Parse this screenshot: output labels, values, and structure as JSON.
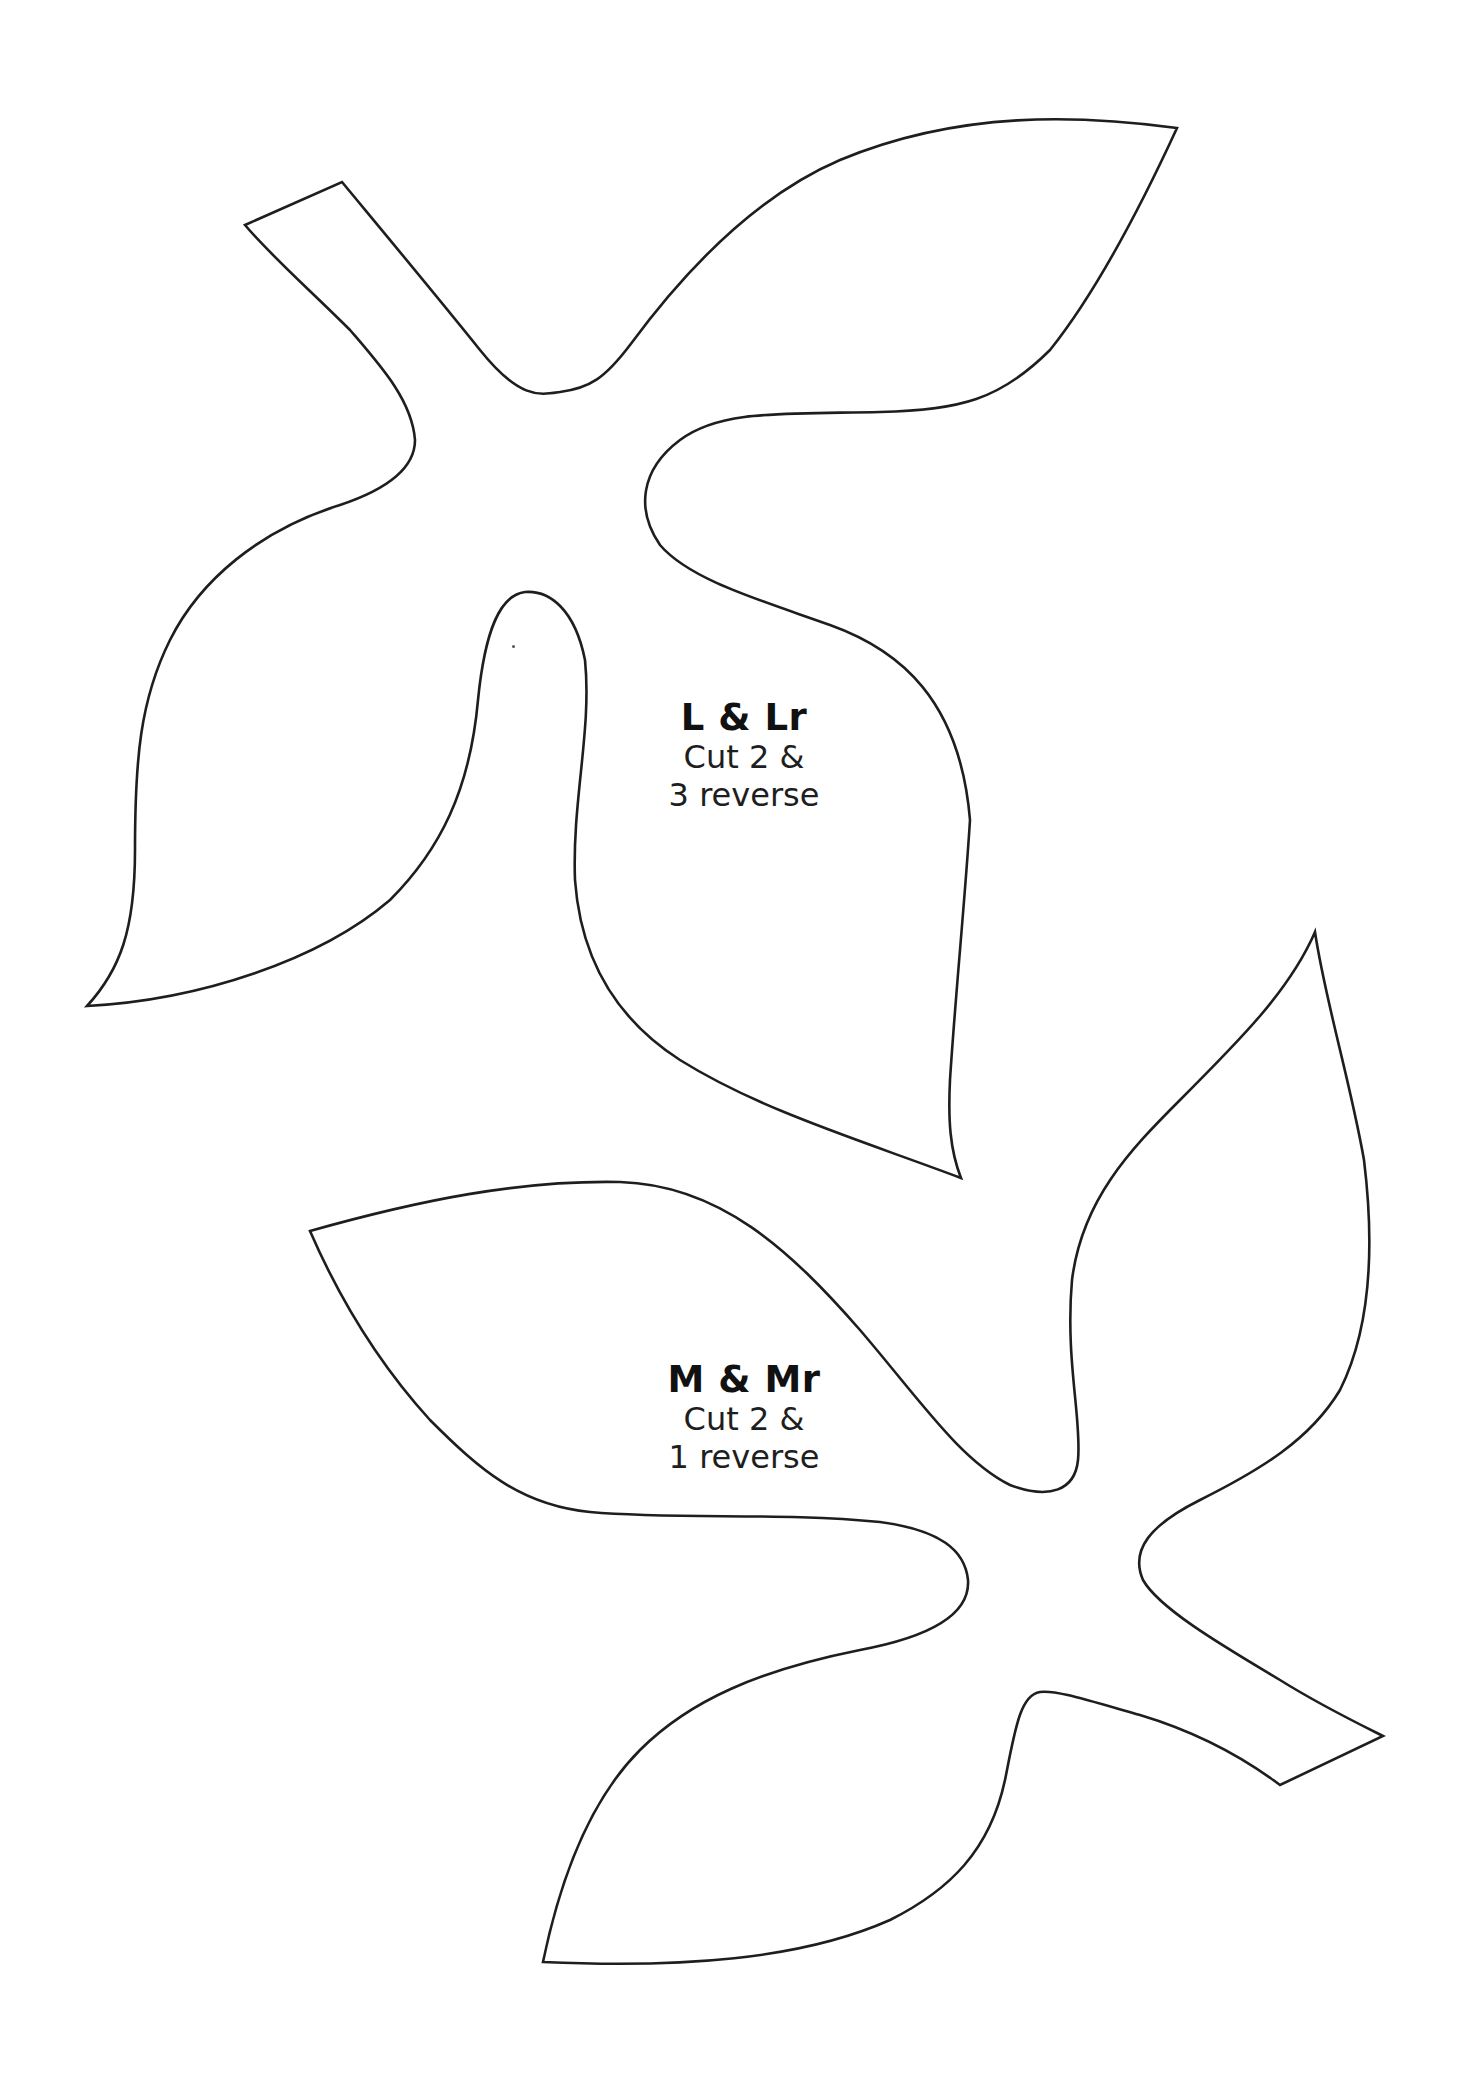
{
  "document": {
    "type": "craft-cutting-template",
    "background": "#ffffff",
    "outline_color": "#1e1e1e"
  },
  "pieces": [
    {
      "id": "L",
      "title": "L & Lr",
      "instruction_line1": "Cut 2 &",
      "instruction_line2": "3 reverse",
      "shape": "three-leaf cluster with stem (upper-left stem, leaves pointing upper-right, left, and down)"
    },
    {
      "id": "M",
      "title": "M & Mr",
      "instruction_line1": "Cut 2 &",
      "instruction_line2": "1 reverse",
      "shape": "three-leaf cluster with stem (lower-right stem, leaves pointing left, upper-right, and down-left)"
    }
  ]
}
